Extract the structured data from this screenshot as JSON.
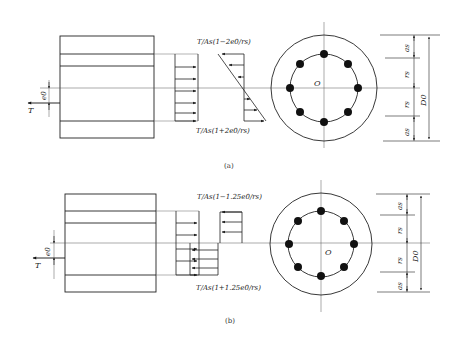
{
  "figure": {
    "panels": [
      {
        "id": "a",
        "caption": "(a)",
        "force_label": "T",
        "eccentricity_label": "e0",
        "center_label": "O",
        "stress_top": "T/As(1−2e0/rs)",
        "stress_bottom": "T/As(1+2e0/rs)",
        "distribution": "linear",
        "dims": {
          "a_top": "as",
          "r_top": "rs",
          "r_bottom": "rs",
          "a_bottom": "as",
          "diameter": "D0"
        },
        "bolt_count": 8
      },
      {
        "id": "b",
        "caption": "(b)",
        "force_label": "T",
        "eccentricity_label": "e0",
        "center_label": "O",
        "stress_top": "T/As(1−1.25e0/rs)",
        "stress_bottom": "T/As(1+1.25e0/rs)",
        "distribution": "stepped",
        "dims": {
          "a_top": "as",
          "r_top": "rs",
          "r_bottom": "rs",
          "a_bottom": "as",
          "diameter": "D0"
        },
        "bolt_count": 8
      }
    ]
  }
}
